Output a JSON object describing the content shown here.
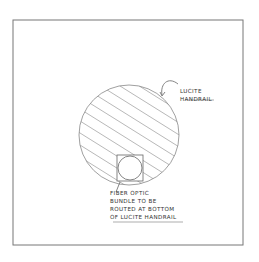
{
  "diagram": {
    "type": "cross-section sketch",
    "frame": {
      "x": 13,
      "y": 20,
      "width": 230,
      "height": 225,
      "stroke": "#777777"
    },
    "handrail": {
      "label_lines": [
        "LUCITE",
        "HANDRAIL"
      ],
      "cx": 129,
      "cy": 135,
      "r": 50,
      "fill_pattern": "diagonal-hatch",
      "stroke": "#888888"
    },
    "fiber_slot": {
      "x": 117,
      "y": 155,
      "size": 26,
      "inner_circle_r": 12
    },
    "fiber_label": {
      "lines": [
        "FIBER OPTIC",
        "BUNDLE TO BE",
        "ROUTED AT BOTTOM",
        "OF LUCITE HANDRAIL"
      ]
    }
  }
}
